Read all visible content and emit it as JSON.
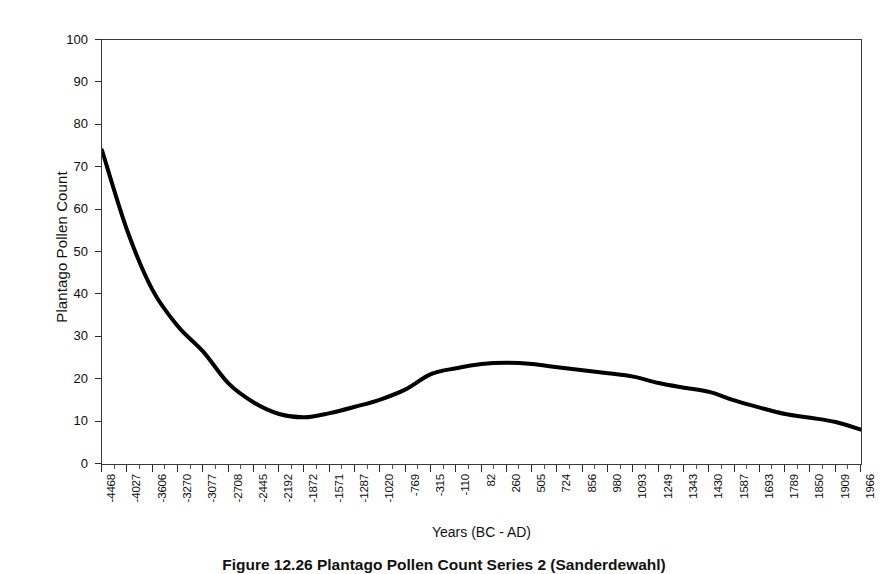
{
  "figure": {
    "caption": "Figure 12.26   Plantago Pollen Count Series 2 (Sanderdewahl)"
  },
  "chart_data": {
    "type": "line",
    "title": "",
    "xlabel": "Years (BC - AD)",
    "ylabel": "Plantago Pollen Count",
    "ylim": [
      0,
      100
    ],
    "yticks": [
      0,
      10,
      20,
      30,
      40,
      50,
      60,
      70,
      80,
      90,
      100
    ],
    "grid": false,
    "legend": "none",
    "line_color": "#000000",
    "line_width": 4,
    "categories": [
      "-4468",
      "-4027",
      "-3606",
      "-3270",
      "-3077",
      "-2708",
      "-2445",
      "-2192",
      "-1872",
      "-1571",
      "-1287",
      "-1020",
      "-769",
      "-315",
      "-110",
      "82",
      "260",
      "505",
      "724",
      "856",
      "980",
      "1093",
      "1249",
      "1343",
      "1430",
      "1587",
      "1693",
      "1789",
      "1850",
      "1909",
      "1966"
    ],
    "values": [
      74.0,
      55.0,
      41.0,
      32.5,
      26.5,
      19.0,
      14.5,
      11.8,
      11.0,
      12.0,
      13.5,
      15.2,
      17.6,
      21.2,
      22.6,
      23.6,
      23.9,
      23.6,
      22.8,
      22.1,
      21.4,
      20.6,
      19.1,
      18.0,
      17.0,
      15.0,
      13.3,
      11.8,
      10.9,
      9.9,
      8.1
    ],
    "xlim_index": [
      0,
      30
    ]
  },
  "axes": {
    "y_ticks": [
      "100",
      "90",
      "80",
      "70",
      "60",
      "50",
      "40",
      "30",
      "20",
      "10",
      "0"
    ]
  }
}
